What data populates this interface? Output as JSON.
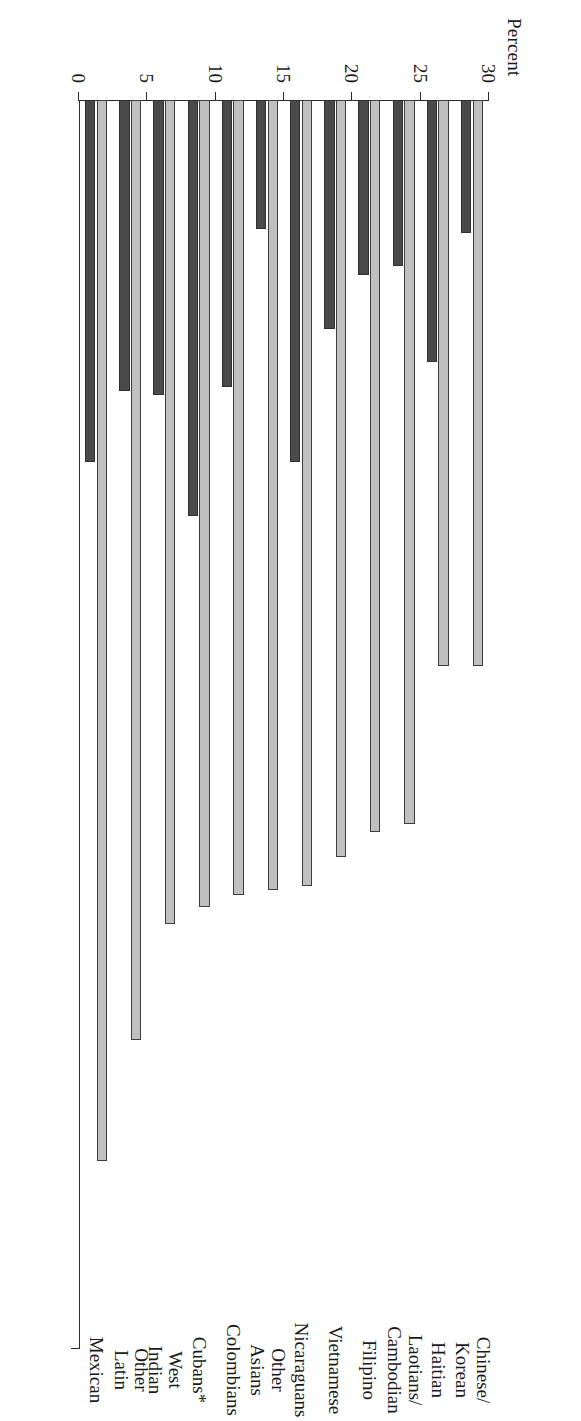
{
  "chart_data": {
    "type": "bar",
    "orientation": "horizontal-rotated",
    "title": "",
    "xlabel": "",
    "ylabel": "Percent",
    "axis_title": "Percent",
    "ylim": [
      0,
      30
    ],
    "tick_labels": [
      "30",
      "25",
      "20",
      "15",
      "10",
      "5",
      "0"
    ],
    "tick_values": [
      30,
      25,
      20,
      15,
      10,
      5,
      0
    ],
    "axis_reversed": true,
    "grid": false,
    "legend_position": "none",
    "footnote": "*",
    "categories": [
      "Mexican",
      "Other\nLatin",
      "West\nIndian",
      "Cubans*",
      "Colombians",
      "Other\nAsians",
      "Nicaraguans",
      "Vietnamese",
      "Filipino",
      "Laotians/\nCambodian",
      "Haitian",
      "Chinese/\nKorean"
    ],
    "series": [
      {
        "name": "light-series",
        "color": "#c0c0c0",
        "values": [
          25.5,
          22.6,
          19.8,
          19.4,
          19.1,
          19.0,
          18.9,
          18.2,
          17.6,
          17.4,
          13.6,
          13.6
        ]
      },
      {
        "name": "dark-series",
        "color": "#4a4a4a",
        "values": [
          8.7,
          7.0,
          7.1,
          10.0,
          6.9,
          3.1,
          8.7,
          5.5,
          4.2,
          4.0,
          6.3,
          3.2
        ]
      }
    ]
  }
}
